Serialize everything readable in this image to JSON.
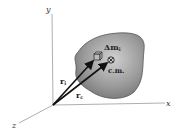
{
  "diagram": {
    "axes": {
      "x": "x",
      "y": "y",
      "z": "z"
    },
    "body_label_mass_element": "Δm",
    "mass_element_subscript": "i",
    "center_of_mass_label": "c.m.",
    "vector_ri": "r",
    "vector_ri_subscript": "i",
    "vector_rc": "r",
    "vector_rc_subscript": "c",
    "colors": {
      "body": "#8f8f8f",
      "body_edge": "#4a4a4a",
      "axis": "#888888",
      "vector": "#111111"
    }
  }
}
